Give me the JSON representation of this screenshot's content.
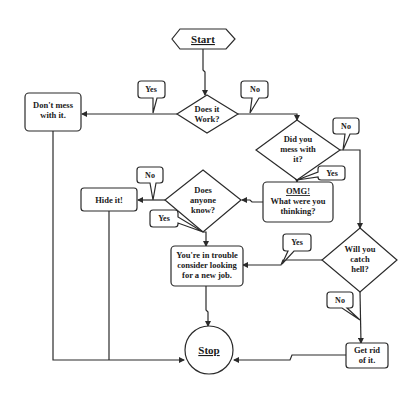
{
  "flowchart": {
    "start": {
      "label": "Start"
    },
    "stop": {
      "label": "Stop"
    },
    "decisions": {
      "does_it_work": {
        "lines": [
          "Does it",
          "Work?"
        ]
      },
      "did_you_mess": {
        "lines": [
          "Did you",
          "mess with",
          "it?"
        ]
      },
      "does_anyone_know": {
        "lines": [
          "Does",
          "anyone",
          "know?"
        ]
      },
      "catch_hell": {
        "lines": [
          "Will you",
          "catch",
          "hell?"
        ]
      }
    },
    "processes": {
      "dont_mess": {
        "lines": [
          "Don't mess",
          "with it."
        ]
      },
      "omg": {
        "lines": [
          "OMG!",
          "What were you",
          "thinking?"
        ]
      },
      "hide_it": {
        "lines": [
          "Hide it!"
        ]
      },
      "in_trouble": {
        "lines": [
          "You're in trouble",
          "consider looking",
          "for a new job."
        ]
      },
      "get_rid": {
        "lines": [
          "Get rid",
          "of it."
        ]
      }
    },
    "callouts": {
      "work_yes": "Yes",
      "work_no": "No",
      "mess_no": "No",
      "mess_yes": "Yes",
      "know_no": "No",
      "know_yes": "Yes",
      "hell_yes": "Yes",
      "hell_no": "No"
    }
  }
}
